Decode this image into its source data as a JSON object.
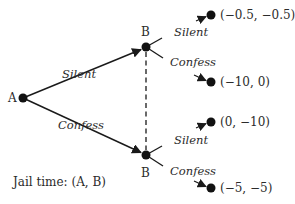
{
  "diagram": {
    "type": "game-tree",
    "colors": {
      "ink": "#1a1a1a",
      "text": "#2b2b2b",
      "background": "#ffffff"
    },
    "nodes": {
      "root": {
        "label": "A",
        "x": 23,
        "y": 98
      },
      "b_upper": {
        "label": "B",
        "x": 146,
        "y": 47
      },
      "b_lower": {
        "label": "B",
        "x": 146,
        "y": 155
      }
    },
    "edges": {
      "a_silent": {
        "label": "Silent",
        "from": "root",
        "to": "b_upper"
      },
      "a_confess": {
        "label": "Confess",
        "from": "root",
        "to": "b_lower"
      },
      "bu_silent": {
        "label": "Silent",
        "from": "b_upper",
        "to": "leaf1"
      },
      "bu_confess": {
        "label": "Confess",
        "from": "b_upper",
        "to": "leaf2"
      },
      "bl_silent": {
        "label": "Silent",
        "from": "b_lower",
        "to": "leaf3"
      },
      "bl_confess": {
        "label": "Confess",
        "from": "b_lower",
        "to": "leaf4"
      }
    },
    "info_set": {
      "style": "dashed",
      "connects": [
        "b_upper",
        "b_lower"
      ]
    },
    "leaves": [
      {
        "id": "leaf1",
        "payoff": "(−0.5, −0.5)"
      },
      {
        "id": "leaf2",
        "payoff": "(−10, 0)"
      },
      {
        "id": "leaf3",
        "payoff": "(0, −10)"
      },
      {
        "id": "leaf4",
        "payoff": "(−5, −5)"
      }
    ],
    "legend": "Jail time: (A, B)"
  }
}
